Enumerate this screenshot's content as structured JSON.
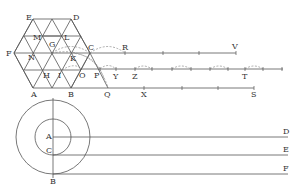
{
  "figure": {
    "hexagon_labels": {
      "E": "E",
      "D": "D",
      "F": "F",
      "C": "C",
      "A": "A",
      "B": "B",
      "M": "M",
      "L": "L",
      "G": "G",
      "N": "N",
      "K": "K",
      "H": "H",
      "I": "I",
      "O": "O",
      "P": "P",
      "Q": "Q"
    },
    "ray_labels": {
      "R": "R",
      "V": "V",
      "Y": "Y",
      "Z": "Z",
      "T": "T",
      "X": "X",
      "S": "S"
    },
    "circle_labels": {
      "A": "A",
      "C": "C",
      "B": "B",
      "D": "D",
      "E": "E",
      "F": "F"
    }
  }
}
